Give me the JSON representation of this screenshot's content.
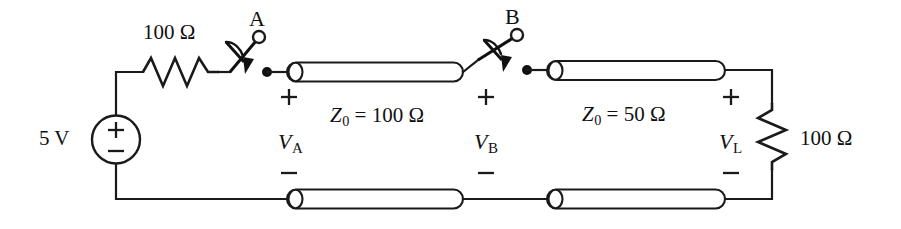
{
  "diagram": {
    "type": "circuit-schematic",
    "colors": {
      "ink": "#1a1a1a",
      "background": "#ffffff"
    },
    "source": {
      "label": "5 V",
      "plus": "+",
      "minus": "−",
      "kind": "dc-voltage-source"
    },
    "source_resistor": {
      "label": "100 Ω",
      "value": 100,
      "unit": "Ω"
    },
    "switches": [
      {
        "name": "A",
        "label": "A",
        "state": "closed-to-line"
      },
      {
        "name": "B",
        "label": "B",
        "state": "closed-to-line"
      }
    ],
    "lines": [
      {
        "name": "line-1",
        "z0_label": "Z",
        "z0_sub": "0",
        "z0_eq": "= 100 Ω",
        "z0_value": 100,
        "unit": "Ω",
        "node_voltage": "V",
        "node_sub": "A",
        "polarity_plus": "+",
        "polarity_minus": "−"
      },
      {
        "name": "line-2",
        "z0_label": "Z",
        "z0_sub": "0",
        "z0_eq": "= 50 Ω",
        "z0_value": 50,
        "unit": "Ω",
        "node_voltage": "V",
        "node_sub": "B",
        "polarity_plus": "+",
        "polarity_minus": "−"
      }
    ],
    "load": {
      "label": "100 Ω",
      "value": 100,
      "unit": "Ω",
      "voltage": "V",
      "voltage_sub": "L",
      "polarity_plus": "+",
      "polarity_minus": "−"
    }
  }
}
